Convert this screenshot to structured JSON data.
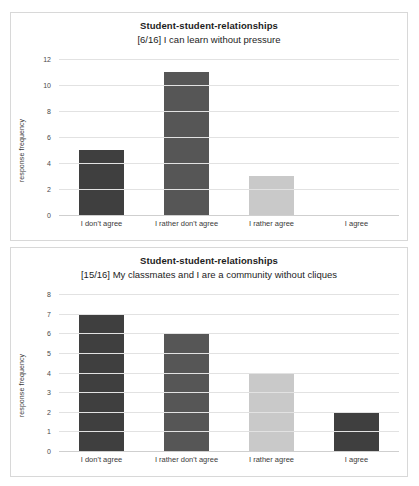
{
  "chart_data": [
    {
      "type": "bar",
      "panel": "top",
      "title": "Student-student-relationships",
      "subtitle": "[6/16] I can learn without pressure",
      "xlabel": "",
      "ylabel": "response frequency",
      "categories": [
        "I don't agree",
        "I rather don't agree",
        "I rather agree",
        "I agree"
      ],
      "values": [
        5,
        11,
        3,
        0
      ],
      "bar_colors": [
        "#3f3f3f",
        "#565656",
        "#c9c9c9",
        "#3f3f3f"
      ],
      "ylim": [
        0,
        12
      ],
      "yticks": [
        0,
        2,
        4,
        6,
        8,
        10,
        12
      ],
      "grid": true,
      "legend": "none"
    },
    {
      "type": "bar",
      "panel": "bottom",
      "title": "Student-student-relationships",
      "subtitle": "[15/16] My classmates and I are a community without cliques",
      "xlabel": "",
      "ylabel": "response frequency",
      "categories": [
        "I don't agree",
        "I rather don't agree",
        "I rather agree",
        "I agree"
      ],
      "values": [
        7,
        6,
        4,
        2
      ],
      "bar_colors": [
        "#3f3f3f",
        "#565656",
        "#c9c9c9",
        "#3f3f3f"
      ],
      "ylim": [
        0,
        8
      ],
      "yticks": [
        0,
        1,
        2,
        3,
        4,
        5,
        6,
        7,
        8
      ],
      "grid": true,
      "legend": "none"
    }
  ],
  "colors": {
    "panel_border": "#d8d8d8",
    "gridline": "#e2e2e2",
    "axis_text": "#3a3a3a",
    "title_text": "#1d1d1d",
    "background": "#ffffff"
  }
}
